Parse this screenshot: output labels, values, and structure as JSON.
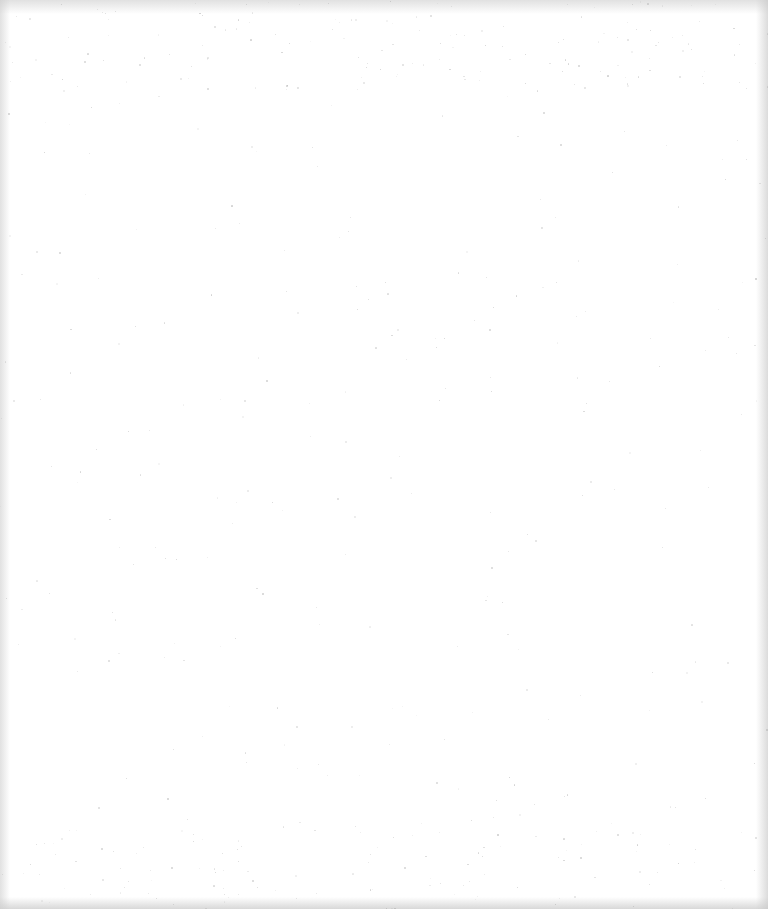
{
  "document": {
    "type": "scanned-page",
    "content": "",
    "is_blank": true
  },
  "colors": {
    "background": "#ffffff",
    "edge_shading": "#c8c8c8",
    "speckle": "#9a9a9a"
  }
}
